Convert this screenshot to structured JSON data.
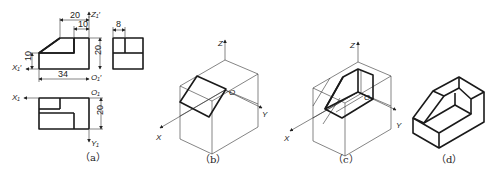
{
  "figure": {
    "panels": [
      {
        "id": "a",
        "caption": "（a）",
        "type": "orthographic three-view",
        "front_view": {
          "dimensions": {
            "top_width": "20",
            "step_width": "10",
            "height": "20",
            "left_height": "10",
            "total_width": "34"
          },
          "axes": {
            "z": "Z₁′",
            "x": "X₁′",
            "origin": "O₁′"
          }
        },
        "side_view": {
          "dimensions": {
            "width": "8"
          }
        },
        "top_view": {
          "dimensions": {
            "depth": "20"
          },
          "axes": {
            "x": "X₁",
            "y": "Y₁",
            "origin": "O₁"
          }
        }
      },
      {
        "id": "b",
        "caption": "（b）",
        "type": "isometric construction step 1",
        "axes": {
          "z": "Z",
          "x": "X",
          "y": "Y",
          "origin": "O"
        }
      },
      {
        "id": "c",
        "caption": "（c）",
        "type": "isometric construction step 2",
        "axes": {
          "z": "Z",
          "x": "X",
          "y": "Y",
          "origin": "O"
        }
      },
      {
        "id": "d",
        "caption": "（d）",
        "type": "finished isometric drawing"
      }
    ]
  }
}
